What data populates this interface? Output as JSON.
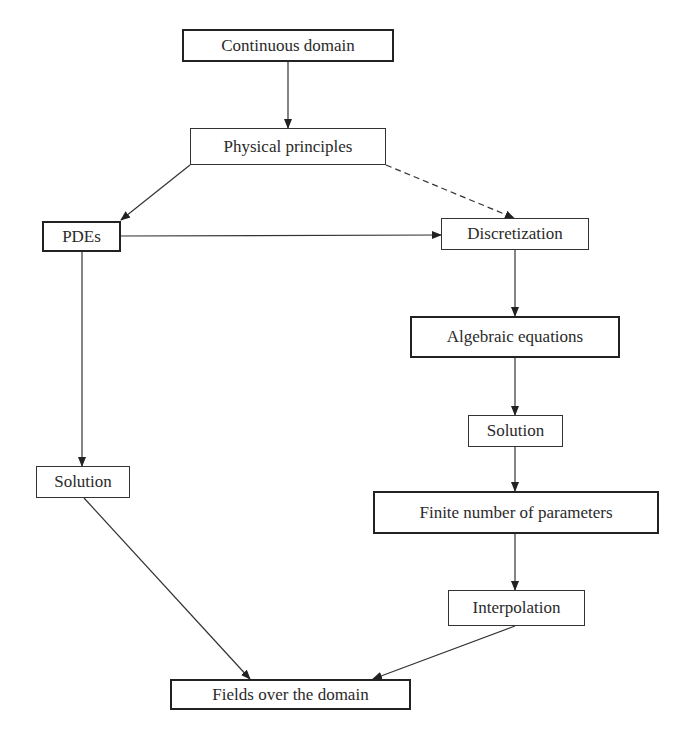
{
  "diagram": {
    "nodes": [
      {
        "id": "continuous",
        "label": "Continuous domain",
        "emphasis": true
      },
      {
        "id": "physical",
        "label": "Physical principles",
        "emphasis": false
      },
      {
        "id": "pdes",
        "label": "PDEs",
        "emphasis": true
      },
      {
        "id": "discretization",
        "label": "Discretization",
        "emphasis": false
      },
      {
        "id": "algebraic",
        "label": "Algebraic equations",
        "emphasis": true
      },
      {
        "id": "solution_right",
        "label": "Solution",
        "emphasis": false
      },
      {
        "id": "finite",
        "label": "Finite number of parameters",
        "emphasis": true
      },
      {
        "id": "interpolation",
        "label": "Interpolation",
        "emphasis": false
      },
      {
        "id": "solution_left",
        "label": "Solution",
        "emphasis": false
      },
      {
        "id": "fields",
        "label": "Fields over the domain",
        "emphasis": true
      }
    ],
    "edges": [
      {
        "from": "continuous",
        "to": "physical",
        "style": "solid"
      },
      {
        "from": "physical",
        "to": "pdes",
        "style": "solid"
      },
      {
        "from": "physical",
        "to": "discretization",
        "style": "dashed"
      },
      {
        "from": "pdes",
        "to": "discretization",
        "style": "solid"
      },
      {
        "from": "discretization",
        "to": "algebraic",
        "style": "solid"
      },
      {
        "from": "algebraic",
        "to": "solution_right",
        "style": "solid"
      },
      {
        "from": "solution_right",
        "to": "finite",
        "style": "solid"
      },
      {
        "from": "finite",
        "to": "interpolation",
        "style": "solid"
      },
      {
        "from": "interpolation",
        "to": "fields",
        "style": "solid"
      },
      {
        "from": "pdes",
        "to": "solution_left",
        "style": "solid"
      },
      {
        "from": "solution_left",
        "to": "fields",
        "style": "solid"
      }
    ]
  }
}
